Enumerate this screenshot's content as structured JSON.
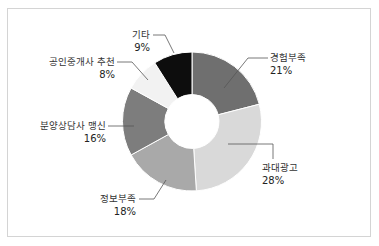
{
  "chart_data": {
    "type": "pie",
    "subtype": "donut",
    "title": "",
    "start_angle_deg": 0,
    "direction": "clockwise",
    "slices": [
      {
        "label": "경험부족",
        "value": 21,
        "pct_label": "21%",
        "color": "#6f6f6f"
      },
      {
        "label": "과대광고",
        "value": 28,
        "pct_label": "28%",
        "color": "#d9d9d9"
      },
      {
        "label": "정보부족",
        "value": 18,
        "pct_label": "18%",
        "color": "#a9a9a9"
      },
      {
        "label": "분양상담사 맹신",
        "value": 16,
        "pct_label": "16%",
        "color": "#7d7d7d"
      },
      {
        "label": "공인중개사 추천",
        "value": 8,
        "pct_label": "8%",
        "color": "#f2f2f2"
      },
      {
        "label": "기타",
        "value": 9,
        "pct_label": "9%",
        "color": "#0d0d0d"
      }
    ],
    "categories": [
      "경험부족",
      "과대광고",
      "정보부족",
      "분양상담사 맹신",
      "공인중개사 추천",
      "기타"
    ],
    "values": [
      21,
      28,
      18,
      16,
      8,
      9
    ],
    "unit": "%",
    "legend": "none (leader-line labels)"
  }
}
